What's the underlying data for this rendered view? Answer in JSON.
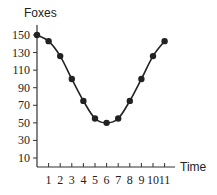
{
  "chart_data": {
    "type": "line",
    "title": "",
    "xlabel": "Time",
    "ylabel": "Foxes",
    "x": [
      0,
      1,
      2,
      3,
      4,
      5,
      6,
      7,
      8,
      9,
      10,
      11
    ],
    "series": [
      {
        "name": "Foxes",
        "values": [
          150,
          143,
          126,
          100,
          75,
          55,
          50,
          55,
          75,
          100,
          126,
          143
        ]
      }
    ],
    "x_ticks": [
      "1",
      "2",
      "3",
      "4",
      "5",
      "6",
      "7",
      "8",
      "9",
      "10",
      "11"
    ],
    "y_ticks": [
      "10",
      "30",
      "50",
      "70",
      "90",
      "110",
      "130",
      "150"
    ],
    "xlim": [
      0,
      12
    ],
    "ylim": [
      0,
      160
    ],
    "grid": false,
    "markers": true,
    "line_color": "#222222"
  }
}
